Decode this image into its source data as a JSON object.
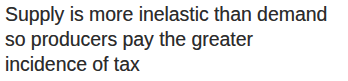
{
  "colors": {
    "background": "#ffffff",
    "text": "#2b2b2b"
  },
  "caption": {
    "full_text": "Supply is more inelastic than demand so producers pay the greater incidence of tax",
    "lines": [
      "Supply is more inelastic than demand",
      "so producers pay the greater",
      "incidence of tax"
    ]
  }
}
